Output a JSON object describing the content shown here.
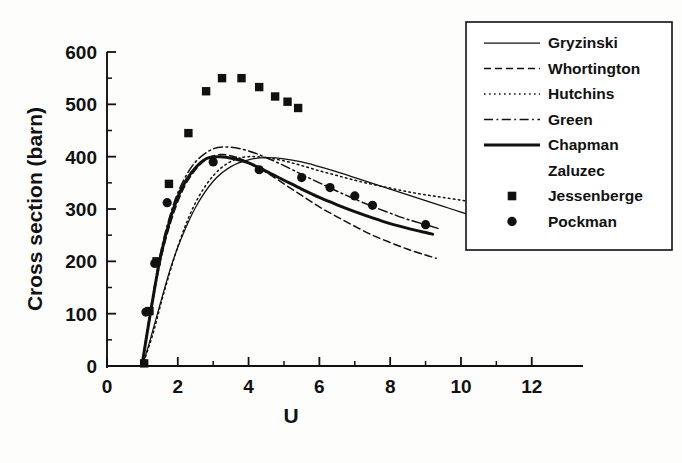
{
  "chart_data": {
    "type": "line",
    "title": "",
    "xlabel": "U",
    "ylabel": "Cross section (barn)",
    "xlim": [
      0,
      12.6
    ],
    "ylim": [
      -15,
      620
    ],
    "x_ticks": [
      0,
      2,
      4,
      6,
      8,
      10,
      12
    ],
    "x_tick_labels": [
      "0",
      "2",
      "4",
      "6",
      "8",
      "10",
      "12"
    ],
    "x_minor_ticks": [
      1,
      3,
      5,
      7,
      9,
      11
    ],
    "y_ticks": [
      0,
      100,
      200,
      300,
      400,
      500,
      600
    ],
    "y_tick_labels": [
      "0",
      "100",
      "200",
      "300",
      "400",
      "500",
      "600"
    ],
    "y_minor_ticks": [
      50,
      150,
      250,
      350,
      450,
      550
    ],
    "grid": false,
    "legend_position": "upper-right-outside",
    "series": [
      {
        "name": "Gryzinski",
        "style": "solid-thin",
        "marker": "none",
        "x": [
          1.0,
          1.2,
          1.5,
          1.8,
          2.1,
          2.5,
          3.0,
          3.5,
          4.0,
          4.5,
          5.0,
          5.5,
          6.0,
          6.5,
          7.0,
          7.5,
          8.0,
          8.5,
          9.0,
          9.5,
          10.0,
          10.6
        ],
        "values": [
          0,
          45,
          118,
          188,
          244,
          303,
          353,
          381,
          394,
          398,
          396,
          390,
          381,
          371,
          360,
          349,
          338,
          327,
          316,
          305,
          294,
          281
        ]
      },
      {
        "name": "Whortington",
        "style": "dashed",
        "marker": "none",
        "x": [
          1.0,
          1.2,
          1.5,
          1.8,
          2.1,
          2.4,
          2.8,
          3.2,
          3.6,
          4.0,
          4.5,
          5.0,
          5.5,
          6.0,
          6.5,
          7.0,
          7.5,
          8.0,
          8.5,
          9.0,
          9.3
        ],
        "values": [
          5,
          88,
          198,
          275,
          330,
          366,
          395,
          404,
          400,
          389,
          370,
          348,
          326,
          304,
          285,
          267,
          250,
          236,
          223,
          212,
          206
        ]
      },
      {
        "name": "Hutchins",
        "style": "dotted",
        "marker": "none",
        "x": [
          1.0,
          1.3,
          1.6,
          2.0,
          2.4,
          2.8,
          3.2,
          3.6,
          4.0,
          4.5,
          5.0,
          5.5,
          6.0,
          6.5,
          7.0,
          7.5,
          8.0,
          8.5,
          9.0,
          9.5,
          10.0,
          10.4
        ],
        "values": [
          0,
          62,
          138,
          228,
          298,
          346,
          377,
          394,
          400,
          398,
          392,
          383,
          373,
          364,
          355,
          347,
          340,
          333,
          327,
          322,
          317,
          313
        ]
      },
      {
        "name": "Green",
        "style": "dash-dot",
        "marker": "none",
        "x": [
          1.0,
          1.2,
          1.5,
          1.8,
          2.1,
          2.5,
          3.0,
          3.5,
          4.0,
          4.5,
          5.0,
          5.5,
          6.0,
          6.5,
          7.0,
          7.5,
          8.0,
          8.5,
          9.0,
          9.4
        ],
        "values": [
          8,
          95,
          212,
          292,
          346,
          390,
          415,
          418,
          411,
          398,
          383,
          366,
          350,
          334,
          319,
          305,
          292,
          280,
          270,
          262
        ]
      },
      {
        "name": "Chapman",
        "style": "solid-thick",
        "marker": "none",
        "x": [
          1.0,
          1.2,
          1.5,
          1.8,
          2.1,
          2.4,
          2.8,
          3.2,
          3.6,
          4.0,
          4.5,
          5.0,
          5.5,
          6.0,
          6.5,
          7.0,
          7.5,
          8.0,
          8.5,
          9.0,
          9.2
        ],
        "values": [
          6,
          90,
          205,
          284,
          338,
          371,
          396,
          400,
          396,
          388,
          372,
          355,
          338,
          322,
          308,
          295,
          283,
          272,
          263,
          255,
          252
        ]
      },
      {
        "name": "Zaluzec",
        "style": "none",
        "marker": "none",
        "x": [],
        "values": []
      },
      {
        "name": "Jessenberge",
        "style": "none",
        "marker": "square",
        "x": [
          1.05,
          1.2,
          1.4,
          1.75,
          2.3,
          2.8,
          3.25,
          3.8,
          4.3,
          4.75,
          5.1,
          5.4
        ],
        "values": [
          5,
          105,
          200,
          348,
          445,
          525,
          550,
          550,
          533,
          515,
          505,
          493
        ]
      },
      {
        "name": "Pockman",
        "style": "none",
        "marker": "circle",
        "x": [
          1.1,
          1.35,
          1.7,
          3.0,
          4.3,
          5.5,
          6.3,
          7.0,
          7.5,
          9.0
        ],
        "values": [
          103,
          196,
          312,
          390,
          375,
          360,
          341,
          325,
          307,
          270
        ]
      }
    ]
  },
  "axes": {
    "y_axis_title": "Cross section (barn)",
    "x_axis_title": "U"
  },
  "legend": {
    "items": [
      {
        "label": "Gryzinski",
        "style": "solid-thin"
      },
      {
        "label": "Whortington",
        "style": "dashed"
      },
      {
        "label": "Hutchins",
        "style": "dotted"
      },
      {
        "label": "Green",
        "style": "dash-dot"
      },
      {
        "label": "Chapman",
        "style": "solid-thick"
      },
      {
        "label": "Zaluzec",
        "style": "none"
      },
      {
        "label": "Jessenberge",
        "style": "square-marker"
      },
      {
        "label": "Pockman",
        "style": "circle-marker"
      }
    ]
  },
  "colors": {
    "ink": "#111111",
    "background": "#fdfdfc"
  }
}
